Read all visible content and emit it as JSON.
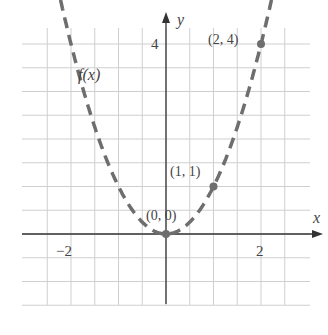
{
  "chart_data": {
    "type": "line",
    "title": "",
    "function_label": "f(x)",
    "xlabel": "x",
    "ylabel": "y",
    "x_tick_labels": [
      "−2",
      "2"
    ],
    "y_tick_labels": [
      "4"
    ],
    "xlim": [
      -3.1,
      3.1
    ],
    "ylim": [
      -1.5,
      4.6
    ],
    "grid": true,
    "grid_step": 0.5,
    "line_style": "dashed",
    "series": [
      {
        "name": "f(x)",
        "formula": "x^2",
        "x": [
          -2.2,
          -2,
          -1.5,
          -1,
          -0.5,
          0,
          0.5,
          1,
          1.5,
          2,
          2.2
        ],
        "values": [
          4.84,
          4,
          2.25,
          1,
          0.25,
          0,
          0.25,
          1,
          2.25,
          4,
          4.84
        ]
      }
    ],
    "annotations": [
      {
        "label": "(0, 0)",
        "x": 0,
        "y": 0
      },
      {
        "label": "(1, 1)",
        "x": 1,
        "y": 1
      },
      {
        "label": "(2, 4)",
        "x": 2,
        "y": 4
      }
    ]
  },
  "colors": {
    "curve": "#6e6e6e",
    "grid": "#cfcfcf",
    "axis": "#333333",
    "text": "#444444"
  }
}
